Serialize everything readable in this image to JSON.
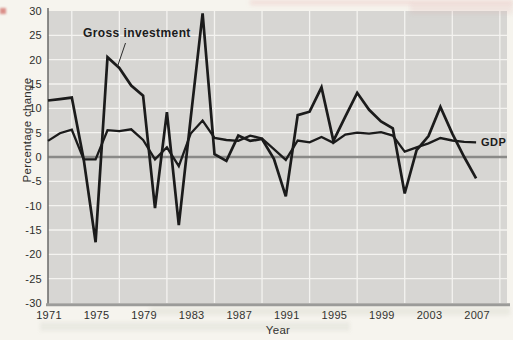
{
  "figure": {
    "investment_annotation": "Gross investment",
    "gdp_annotation": "GDP"
  },
  "chart_data": {
    "type": "line",
    "title": "",
    "xlabel": "Year",
    "ylabel": "Percentage change",
    "x": [
      1971,
      1972,
      1973,
      1974,
      1975,
      1976,
      1977,
      1978,
      1979,
      1980,
      1981,
      1982,
      1983,
      1984,
      1985,
      1986,
      1987,
      1988,
      1989,
      1990,
      1991,
      1992,
      1993,
      1994,
      1995,
      1996,
      1997,
      1998,
      1999,
      2000,
      2001,
      2002,
      2003,
      2004,
      2005,
      2006,
      2007
    ],
    "series": [
      {
        "name": "Gross investment",
        "values": [
          11.6,
          11.9,
          12.2,
          -0.5,
          -17.5,
          20.5,
          18.3,
          14.7,
          12.6,
          -10.5,
          9.2,
          -14.0,
          8.0,
          29.5,
          0.6,
          -0.8,
          4.4,
          3.3,
          3.7,
          -0.4,
          -8.1,
          8.6,
          9.3,
          14.3,
          3.3,
          8.3,
          13.2,
          9.7,
          7.3,
          5.9,
          -7.5,
          1.4,
          4.3,
          10.3,
          4.8,
          0.0,
          -4.4
        ]
      },
      {
        "name": "GDP",
        "values": [
          3.3,
          4.9,
          5.6,
          -0.5,
          -0.5,
          5.5,
          5.3,
          5.7,
          3.5,
          -0.5,
          2.0,
          -1.9,
          4.8,
          7.5,
          3.9,
          3.5,
          3.3,
          4.4,
          3.8,
          1.6,
          -0.6,
          3.4,
          3.0,
          4.1,
          2.9,
          4.6,
          5.0,
          4.8,
          5.1,
          4.4,
          1.1,
          2.0,
          2.8,
          3.9,
          3.4,
          3.1,
          3.0
        ]
      }
    ],
    "xlim": [
      1971,
      2009.6
    ],
    "ylim": [
      -30,
      30
    ],
    "x_ticks": [
      1971,
      1975,
      1979,
      1983,
      1987,
      1991,
      1995,
      1999,
      2003,
      2007
    ],
    "y_ticks": [
      30,
      25,
      20,
      15,
      10,
      5,
      0,
      -5,
      -10,
      -15,
      -20,
      -25,
      -30
    ],
    "x_gridlines": [
      1973,
      1977,
      1981,
      1985,
      1989,
      1993,
      1997,
      2001,
      2005,
      2009
    ],
    "y_gridlines": [
      25,
      20,
      15,
      10,
      5,
      -5,
      -10,
      -15,
      -20,
      -25
    ],
    "zero_line_value": 0,
    "grid": true,
    "legend_position": "inline annotations on plot",
    "colors": {
      "page_background": "#f6f4ee",
      "panel_background": "#d7d6d3",
      "gridline": "#f4f3f0",
      "zero_line": "#8a8a88",
      "line": "#1b1b1b",
      "axis_left": "#6a6a68",
      "axis_bottom": "#9c9c9a",
      "text": "#2e2e2c"
    }
  }
}
